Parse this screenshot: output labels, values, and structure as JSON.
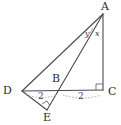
{
  "figure": {
    "type": "geometry-diagram",
    "background_color": "#ffffff",
    "stroke_color": "#4a4a4a",
    "text_color": "#2b2b2b"
  },
  "vertices": [
    {
      "id": "A",
      "label": "A",
      "x": 103,
      "y": 14
    },
    {
      "id": "B",
      "label": "B",
      "x": 60,
      "y": 88
    },
    {
      "id": "C",
      "label": "C",
      "x": 103,
      "y": 90
    },
    {
      "id": "D",
      "label": "D",
      "x": 22,
      "y": 91
    },
    {
      "id": "E",
      "label": "E",
      "x": 47,
      "y": 110
    }
  ],
  "vertex_labels": [
    {
      "name": "vertex-label-a",
      "text": "A",
      "left": 101,
      "top": 2
    },
    {
      "name": "vertex-label-b",
      "text": "B",
      "left": 53,
      "top": 73
    },
    {
      "name": "vertex-label-c",
      "text": "C",
      "left": 107,
      "top": 87
    },
    {
      "name": "vertex-label-d",
      "text": "D",
      "left": 3,
      "top": 85
    },
    {
      "name": "vertex-label-e",
      "text": "E",
      "left": 43,
      "top": 112
    }
  ],
  "segments": [
    {
      "name": "segment-a-c",
      "from": "A",
      "to": "C",
      "style": "solid"
    },
    {
      "name": "segment-a-d",
      "from": "A",
      "to": "D",
      "style": "solid"
    },
    {
      "name": "segment-a-e",
      "from": "A",
      "to": "E",
      "style": "solid"
    },
    {
      "name": "segment-d-c",
      "from": "D",
      "to": "C",
      "style": "solid"
    },
    {
      "name": "segment-d-e",
      "from": "D",
      "to": "E",
      "style": "solid"
    }
  ],
  "angle_labels": [
    {
      "name": "angle-label-y",
      "text": "y",
      "left": 85,
      "top": 31
    },
    {
      "name": "angle-label-x",
      "text": "x",
      "left": 95,
      "top": 31
    }
  ],
  "measurements": [
    {
      "name": "measure-d-b",
      "text": "2",
      "left": 38,
      "top": 92
    },
    {
      "name": "measure-b-c",
      "text": "2",
      "left": 78,
      "top": 92
    }
  ],
  "right_angles": [
    {
      "name": "right-angle-at-c",
      "vertex": "C",
      "size": 6
    },
    {
      "name": "right-angle-at-e",
      "vertex": "E",
      "size": 5
    }
  ]
}
